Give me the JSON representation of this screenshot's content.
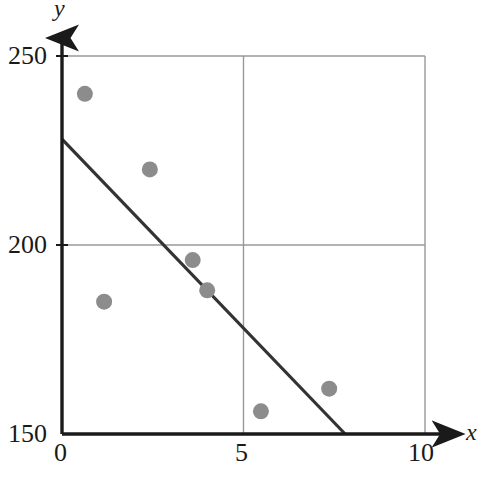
{
  "chart_data": {
    "type": "scatter",
    "title": "",
    "subtitle": "",
    "xlabel": "x",
    "ylabel": "y",
    "xlim": [
      0,
      10
    ],
    "ylim": [
      150,
      250
    ],
    "xticks": [
      0,
      5,
      10
    ],
    "yticks": [
      150,
      200,
      250
    ],
    "xtick_labels": [
      "0",
      "5",
      "10"
    ],
    "ytick_labels": [
      "150",
      "200",
      "250"
    ],
    "grid": true,
    "grid_color": "#999999",
    "legend": "none",
    "point_color": "#8c8c8c",
    "point_radius": 8,
    "line_color": "#333333",
    "axis_color": "#1a1a1a",
    "points": [
      {
        "x": 0.63,
        "y": 240
      },
      {
        "x": 1.16,
        "y": 185
      },
      {
        "x": 2.42,
        "y": 220
      },
      {
        "x": 3.6,
        "y": 196
      },
      {
        "x": 4.0,
        "y": 188
      },
      {
        "x": 5.48,
        "y": 156
      },
      {
        "x": 7.36,
        "y": 162
      }
    ],
    "series": [
      {
        "name": "data points",
        "type": "scatter",
        "x": [
          0.63,
          1.16,
          2.42,
          3.6,
          4.0,
          5.48,
          7.36
        ],
        "values": [
          240,
          185,
          220,
          196,
          188,
          156,
          162
        ]
      },
      {
        "name": "trend line",
        "type": "line",
        "x": [
          0,
          7.8
        ],
        "values": [
          228,
          150
        ]
      }
    ],
    "trend_line": {
      "x_start": 0,
      "y_start": 228,
      "x_end": 7.8,
      "y_end": 150,
      "slope": -10,
      "intercept": 228
    },
    "annotations": []
  },
  "axis": {
    "y_title": "y",
    "x_title": "x"
  }
}
